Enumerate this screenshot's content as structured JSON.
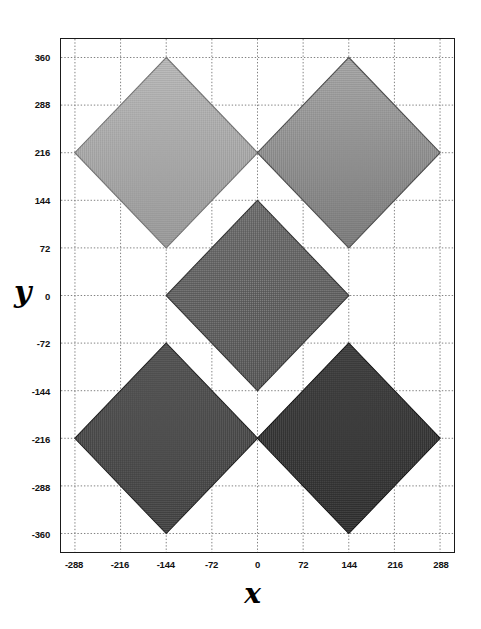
{
  "chart_data": {
    "type": "scatter",
    "title": "",
    "xlabel": "x",
    "ylabel": "y",
    "xlim": [
      -310,
      310
    ],
    "ylim": [
      -388,
      388
    ],
    "xticks": [
      -288,
      -216,
      -144,
      -72,
      0,
      72,
      144,
      216,
      288
    ],
    "yticks": [
      360,
      288,
      216,
      144,
      72,
      0,
      -72,
      -144,
      -216,
      -288,
      -360
    ],
    "xtick_labels": [
      "-288",
      "-216",
      "-144",
      "-72",
      "0",
      "72",
      "144",
      "216",
      "288"
    ],
    "ytick_labels": [
      "360",
      "288",
      "216",
      "144",
      "72",
      "0",
      "-72",
      "-144",
      "-216",
      "-288",
      "-360"
    ],
    "grid": true,
    "grid_style": "dotted",
    "grid_color": "#808080",
    "frame_color": "#1a1a1a",
    "background": "#ffffff",
    "legend": "none",
    "marker_shape": "diamond",
    "points": [
      {
        "name": "top-left-diamond",
        "x": -144,
        "y": 216,
        "half_width": 144,
        "half_height": 144,
        "fill": "#b0b0b0",
        "fill_dark": "#8d8d8d",
        "edge": "#6e6e6e",
        "shade": "light"
      },
      {
        "name": "top-right-diamond",
        "x": 144,
        "y": 216,
        "half_width": 144,
        "half_height": 144,
        "fill": "#9a9a9a",
        "fill_dark": "#6a6a6a",
        "edge": "#454545",
        "shade": "medium-light"
      },
      {
        "name": "center-diamond",
        "x": 0,
        "y": 0,
        "half_width": 144,
        "half_height": 144,
        "fill": "#5a5a5a",
        "fill_dark": "#444444",
        "edge": "#2a2a2a",
        "shade": "medium-dark"
      },
      {
        "name": "bottom-left-diamond",
        "x": -144,
        "y": -216,
        "half_width": 144,
        "half_height": 144,
        "fill": "#3b3b3b",
        "fill_dark": "#2a2a2a",
        "edge": "#161616",
        "shade": "dark"
      },
      {
        "name": "bottom-right-diamond",
        "x": 144,
        "y": -216,
        "half_width": 144,
        "half_height": 144,
        "fill": "#232323",
        "fill_dark": "#141414",
        "edge": "#090909",
        "shade": "darkest"
      }
    ]
  }
}
